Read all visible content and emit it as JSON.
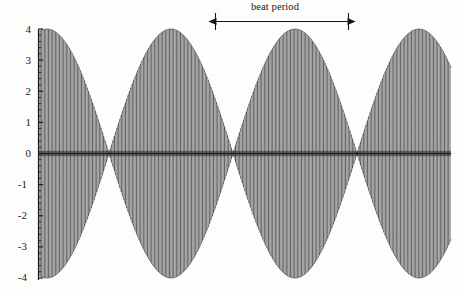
{
  "figure": {
    "background_color": "#fdfdfc",
    "ink_color": "#1a1a1a",
    "width": 463,
    "height": 295
  },
  "annotation": {
    "beat_period_label": "beat period",
    "arrow_style": "double-headed-arrow-with-end-bars"
  },
  "axis": {
    "y_tick_labels": [
      "4",
      "3",
      "2",
      "1",
      "0",
      "-1",
      "-2",
      "-3",
      "-4"
    ],
    "y_tick_values": [
      4,
      3,
      2,
      1,
      0,
      -1,
      -2,
      -3,
      -4
    ],
    "minor_ticks_per_interval": 5,
    "x_axis_visible_as_zero_line": true,
    "x_tick_labels": []
  },
  "chart_data": {
    "type": "line",
    "title": "",
    "subtitle": "",
    "xlabel": "",
    "ylabel": "",
    "grid": false,
    "legend_position": "none",
    "ylim": [
      -4,
      4
    ],
    "xlim": [
      0,
      1
    ],
    "annotations": [
      {
        "text": "beat period",
        "type": "span-arrow",
        "x_start_px": 215,
        "x_end_px": 348,
        "y_px": 18
      }
    ],
    "series": [
      {
        "name": "beat waveform",
        "envelope_amplitude": 4,
        "carrier_cycles_across_axis": 150,
        "beat_nodes_px": [
          47,
          168,
          292,
          418
        ],
        "beat_antinodes_px": [
          107,
          230,
          355
        ],
        "beat_period_px": 124,
        "color": "#1a1a1a"
      }
    ],
    "envelope_nodes_normalized": [
      0.022,
      0.316,
      0.617,
      0.923
    ],
    "envelope_antinodes_normalized": [
      0.168,
      0.466,
      0.77
    ],
    "y_axis_ticks": [
      4,
      3,
      2,
      1,
      0,
      -1,
      -2,
      -3,
      -4
    ]
  }
}
